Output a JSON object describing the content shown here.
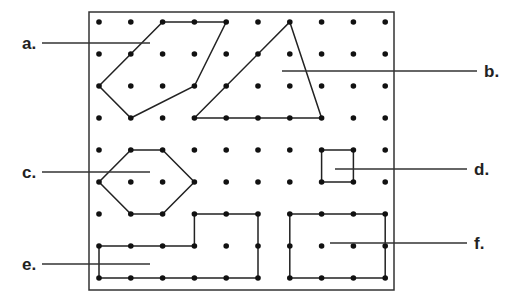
{
  "diagram": {
    "type": "geoboard",
    "grid": {
      "cols": 10,
      "rows": 9,
      "x0": 99,
      "y0": 22,
      "dx": 31.8,
      "dy": 32
    },
    "frame": {
      "x": 89,
      "y": 12,
      "w": 305,
      "h": 278
    },
    "shapes": [
      {
        "id": "a",
        "label": "a.",
        "points": [
          [
            2,
            0
          ],
          [
            4,
            0
          ],
          [
            3,
            2
          ],
          [
            1,
            3
          ],
          [
            0,
            2
          ]
        ]
      },
      {
        "id": "b",
        "label": "b.",
        "points": [
          [
            6,
            0
          ],
          [
            7,
            3
          ],
          [
            3,
            3
          ]
        ]
      },
      {
        "id": "c",
        "label": "c.",
        "points": [
          [
            1,
            4
          ],
          [
            2,
            4
          ],
          [
            3,
            5
          ],
          [
            2,
            6
          ],
          [
            1,
            6
          ],
          [
            0,
            5
          ]
        ]
      },
      {
        "id": "d",
        "label": "d.",
        "points": [
          [
            7,
            4
          ],
          [
            8,
            4
          ],
          [
            8,
            5
          ],
          [
            7,
            5
          ]
        ]
      },
      {
        "id": "e",
        "label": "e.",
        "points": [
          [
            3,
            6
          ],
          [
            5,
            6
          ],
          [
            5,
            8
          ],
          [
            0,
            8
          ],
          [
            0,
            7
          ],
          [
            3,
            7
          ]
        ]
      },
      {
        "id": "f",
        "label": "f.",
        "points": [
          [
            6,
            6
          ],
          [
            9,
            6
          ],
          [
            9,
            8
          ],
          [
            6,
            8
          ]
        ]
      }
    ],
    "labels": [
      {
        "id": "a",
        "text": "a.",
        "x": 22,
        "y": 34,
        "line": [
          42,
          43,
          150,
          43
        ]
      },
      {
        "id": "b",
        "text": "b.",
        "x": 484,
        "y": 62,
        "line": [
          282,
          71,
          477,
          71
        ]
      },
      {
        "id": "c",
        "text": "c.",
        "x": 22,
        "y": 163,
        "line": [
          42,
          172,
          150,
          172
        ]
      },
      {
        "id": "d",
        "text": "d.",
        "x": 474,
        "y": 160,
        "line": [
          335,
          169,
          467,
          169
        ]
      },
      {
        "id": "e",
        "text": "e.",
        "x": 22,
        "y": 255,
        "line": [
          42,
          264,
          150,
          264
        ]
      },
      {
        "id": "f",
        "text": "f.",
        "x": 474,
        "y": 234,
        "line": [
          330,
          243,
          467,
          243
        ]
      }
    ]
  }
}
